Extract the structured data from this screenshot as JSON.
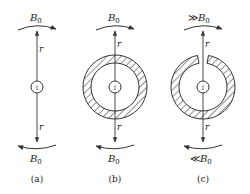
{
  "figure": {
    "panels": [
      {
        "id": "a",
        "caption": "(a)",
        "top_field": "B",
        "top_sub": "0",
        "top_prefix": "",
        "bottom_field": "B",
        "bottom_sub": "0",
        "bottom_prefix": "",
        "radius_label": "r",
        "current_label": "I",
        "shield": "none"
      },
      {
        "id": "b",
        "caption": "(b)",
        "top_field": "B",
        "top_sub": "0",
        "top_prefix": "",
        "bottom_field": "B",
        "bottom_sub": "0",
        "bottom_prefix": "",
        "radius_label": "r",
        "current_label": "I",
        "shield": "closed-ring"
      },
      {
        "id": "c",
        "caption": "(c)",
        "top_field": "B",
        "top_sub": "0",
        "top_prefix": "≫",
        "bottom_field": "B",
        "bottom_sub": "0",
        "bottom_prefix": "≪",
        "radius_label": "r",
        "current_label": "I",
        "shield": "slotted-ring"
      }
    ]
  }
}
